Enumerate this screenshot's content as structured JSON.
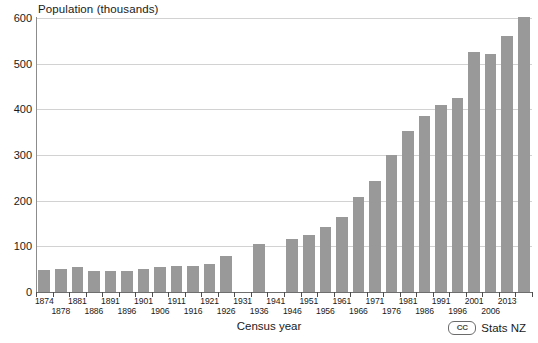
{
  "chart_data": {
    "type": "bar",
    "title": "",
    "ylabel": "Population (thousands)",
    "xlabel": "Census year",
    "ylim": [
      0,
      600
    ],
    "ytick_labels": [
      "0",
      "100",
      "200",
      "300",
      "400",
      "500",
      "600"
    ],
    "ytick_values": [
      0,
      100,
      200,
      300,
      400,
      500,
      600
    ],
    "grid": true,
    "legend": false,
    "categories": [
      "1874",
      "1878",
      "1881",
      "1886",
      "1891",
      "1896",
      "1901",
      "1906",
      "1911",
      "1916",
      "1921",
      "1926",
      "1931",
      "1936",
      "1945",
      "1951",
      "1956",
      "1961",
      "1966",
      "1971",
      "1976",
      "1981",
      "1986",
      "1991",
      "1996",
      "2001",
      "2006",
      "2013"
    ],
    "values": [
      48,
      51,
      55,
      47,
      47,
      47,
      50,
      54,
      56,
      56,
      61,
      78,
      null,
      105,
      115,
      124,
      142,
      164,
      209,
      243,
      299,
      353,
      385,
      410,
      424,
      525,
      521,
      560
    ],
    "bar_color": "#999999",
    "note": "Census not held in 1931"
  },
  "axis": {
    "y_title": "Population (thousands)",
    "x_title": "Census year"
  },
  "x_tick_labels": [
    {
      "label": "1874",
      "row": "top"
    },
    {
      "label": "1878",
      "row": "bot"
    },
    {
      "label": "1881",
      "row": "top"
    },
    {
      "label": "1886",
      "row": "bot"
    },
    {
      "label": "1891",
      "row": "top"
    },
    {
      "label": "1896",
      "row": "bot"
    },
    {
      "label": "1901",
      "row": "top"
    },
    {
      "label": "1906",
      "row": "bot"
    },
    {
      "label": "1911",
      "row": "top"
    },
    {
      "label": "1916",
      "row": "bot"
    },
    {
      "label": "1921",
      "row": "top"
    },
    {
      "label": "1926",
      "row": "bot"
    },
    {
      "label": "1931",
      "row": "top"
    },
    {
      "label": "1936",
      "row": "bot"
    },
    {
      "label": "1941",
      "row": "top"
    },
    {
      "label": "1946",
      "row": "bot"
    },
    {
      "label": "1951",
      "row": "top"
    },
    {
      "label": "1956",
      "row": "bot"
    },
    {
      "label": "1961",
      "row": "top"
    },
    {
      "label": "1966",
      "row": "bot"
    },
    {
      "label": "1971",
      "row": "top"
    },
    {
      "label": "1976",
      "row": "bot"
    },
    {
      "label": "1981",
      "row": "top"
    },
    {
      "label": "1986",
      "row": "bot"
    },
    {
      "label": "1991",
      "row": "top"
    },
    {
      "label": "1996",
      "row": "bot"
    },
    {
      "label": "2001",
      "row": "top"
    },
    {
      "label": "2006",
      "row": "bot"
    },
    {
      "label": "2013",
      "row": "top"
    }
  ],
  "bars": [
    {
      "year": "1874",
      "value": 48
    },
    {
      "year": "1878",
      "value": 51
    },
    {
      "year": "1881",
      "value": 55
    },
    {
      "year": "1886",
      "value": 47
    },
    {
      "year": "1891",
      "value": 47
    },
    {
      "year": "1896",
      "value": 47
    },
    {
      "year": "1901",
      "value": 50
    },
    {
      "year": "1906",
      "value": 54
    },
    {
      "year": "1911",
      "value": 56
    },
    {
      "year": "1916",
      "value": 56
    },
    {
      "year": "1921",
      "value": 61
    },
    {
      "year": "1926",
      "value": 78
    },
    {
      "year": "1931",
      "value": null
    },
    {
      "year": "1936",
      "value": 105
    },
    {
      "year": "1941",
      "value": null
    },
    {
      "year": "1946",
      "value": 115
    },
    {
      "year": "1951",
      "value": 124
    },
    {
      "year": "1956",
      "value": 142
    },
    {
      "year": "1961",
      "value": 164
    },
    {
      "year": "1966",
      "value": 209
    },
    {
      "year": "1971",
      "value": 243
    },
    {
      "year": "1976",
      "value": 299
    },
    {
      "year": "1981",
      "value": 353
    },
    {
      "year": "1986",
      "value": 385
    },
    {
      "year": "1991",
      "value": 410
    },
    {
      "year": "1996",
      "value": 424
    },
    {
      "year": "2001",
      "value": 525
    },
    {
      "year": "2006",
      "value": 521
    },
    {
      "year": "2013",
      "value": 560
    },
    {
      "year": "2013b",
      "value": 603
    }
  ],
  "brand": {
    "cc_mark": "CC",
    "name": "Stats NZ"
  }
}
